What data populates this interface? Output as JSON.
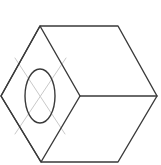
{
  "figure": {
    "width": 161,
    "height": 165,
    "background_color": "#ffffff",
    "stroke_color": "#3a3a3a",
    "construction_stroke_color": "#c9c9c9",
    "stroke_width": 1.4,
    "construction_stroke_width": 1.0,
    "shapes": {
      "outer_hexagon": {
        "name": "outer-hexagon",
        "points": "40,26 118,26 157,96 118,162 41,162 1,96",
        "description": "Outer hexagonal silhouette of the isometric cube"
      },
      "left_diamond": {
        "name": "left-face-diamond",
        "points": "40,26 80,96 41,162 1,96",
        "description": "Front-left rhombus face of the isometric cube"
      },
      "center_horizontal_edge": {
        "name": "center-horizontal-edge",
        "x1": 80,
        "y1": 96,
        "x2": 157,
        "y2": 96,
        "description": "Horizontal edge from diamond right vertex to hexagon right vertex"
      },
      "hole_ellipse": {
        "name": "hole-ellipse",
        "cx": 40,
        "cy": 96,
        "rx": 15,
        "ry": 27,
        "description": "Circular through-hole drawn as an ellipse in isometric projection"
      },
      "centerline_a": {
        "name": "centerline-down-right",
        "x1": 15,
        "y1": 58,
        "x2": 65,
        "y2": 134,
        "description": "Light grey construction centerline running down-right"
      },
      "centerline_b": {
        "name": "centerline-down-left",
        "x1": 66,
        "y1": 58,
        "x2": 15,
        "y2": 134,
        "description": "Light grey construction centerline running down-left"
      }
    }
  }
}
